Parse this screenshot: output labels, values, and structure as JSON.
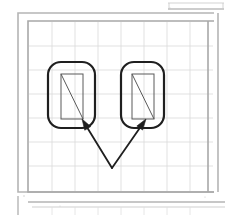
{
  "document": {
    "title": "Scanned technical drawing figure",
    "background_color": "#ffffff",
    "width": 225,
    "height": 215
  },
  "colors": {
    "paper": "#ffffff",
    "grid_line": "#d9d9d9",
    "grid_line_major": "#cfcfcf",
    "frame_outer": "#b5b5b5",
    "frame_inner": "#a8a8a8",
    "ink_dark": "#1f1f1f",
    "ink_medium": "#4a4a4a",
    "ink_thin": "#5a5a5a",
    "speck": "#c8c8c8"
  },
  "top_fragment": {
    "label": "partial-table-edge-top-right",
    "x": 168,
    "y": 2,
    "width": 56,
    "height": 7,
    "stroke": "#bdbdbd"
  },
  "frame": {
    "label": "double-ruled-border",
    "outer": {
      "x": 18,
      "y": 13,
      "width": 196,
      "height": 179,
      "stroke": "#b5b5b5",
      "stroke_width": 1.6
    },
    "inner": {
      "x": 28,
      "y": 21,
      "width": 186,
      "height": 171,
      "stroke": "#a8a8a8",
      "stroke_width": 1.6
    }
  },
  "grid": {
    "label": "graph-paper-grid",
    "x": 29,
    "y": 22,
    "width": 184,
    "height": 169,
    "cell_width": 23,
    "cell_height": 24,
    "columns": 8,
    "rows": 7,
    "stroke": "#d9d9d9",
    "stroke_width": 0.8
  },
  "bottom_fragment": {
    "label": "partial-table-edge-bottom",
    "x": 28,
    "y": 202,
    "width": 197,
    "height": 13,
    "stroke": "#bdbdbd"
  },
  "devices": [
    {
      "name": "left-device",
      "rounded_rect": {
        "x": 48,
        "y": 62,
        "width": 47,
        "height": 66,
        "radius": 13,
        "stroke": "#1f1f1f",
        "stroke_width": 2.2,
        "fill": "none"
      },
      "inner_rect": {
        "x": 61,
        "y": 74,
        "width": 22,
        "height": 45,
        "stroke": "#5a5a5a",
        "stroke_width": 1.0,
        "fill": "none"
      },
      "diagonal": {
        "x1": 61,
        "y1": 74,
        "x2": 83,
        "y2": 119,
        "stroke": "#5a5a5a",
        "stroke_width": 1.0
      }
    },
    {
      "name": "right-device",
      "rounded_rect": {
        "x": 121,
        "y": 62,
        "width": 43,
        "height": 66,
        "radius": 13,
        "stroke": "#1f1f1f",
        "stroke_width": 2.2,
        "fill": "none"
      },
      "inner_rect": {
        "x": 132,
        "y": 74,
        "width": 22,
        "height": 45,
        "stroke": "#5a5a5a",
        "stroke_width": 1.0,
        "fill": "none"
      },
      "diagonal": {
        "x1": 132,
        "y1": 74,
        "x2": 154,
        "y2": 119,
        "stroke": "#5a5a5a",
        "stroke_width": 1.0
      }
    }
  ],
  "arrows": [
    {
      "name": "left-arrow",
      "from_x": 112,
      "from_y": 168,
      "to_x": 82,
      "to_y": 119,
      "stroke": "#1f1f1f",
      "stroke_width": 1.8,
      "head_length": 11,
      "head_width": 7
    },
    {
      "name": "right-arrow",
      "from_x": 112,
      "from_y": 168,
      "to_x": 146,
      "to_y": 119,
      "stroke": "#1f1f1f",
      "stroke_width": 1.8,
      "head_length": 11,
      "head_width": 7
    }
  ],
  "specks": [
    {
      "x": 24,
      "y": 196,
      "r": 0.7
    },
    {
      "x": 205,
      "y": 197,
      "r": 0.6
    },
    {
      "x": 170,
      "y": 8,
      "r": 0.6
    },
    {
      "x": 60,
      "y": 206,
      "r": 0.5
    }
  ]
}
